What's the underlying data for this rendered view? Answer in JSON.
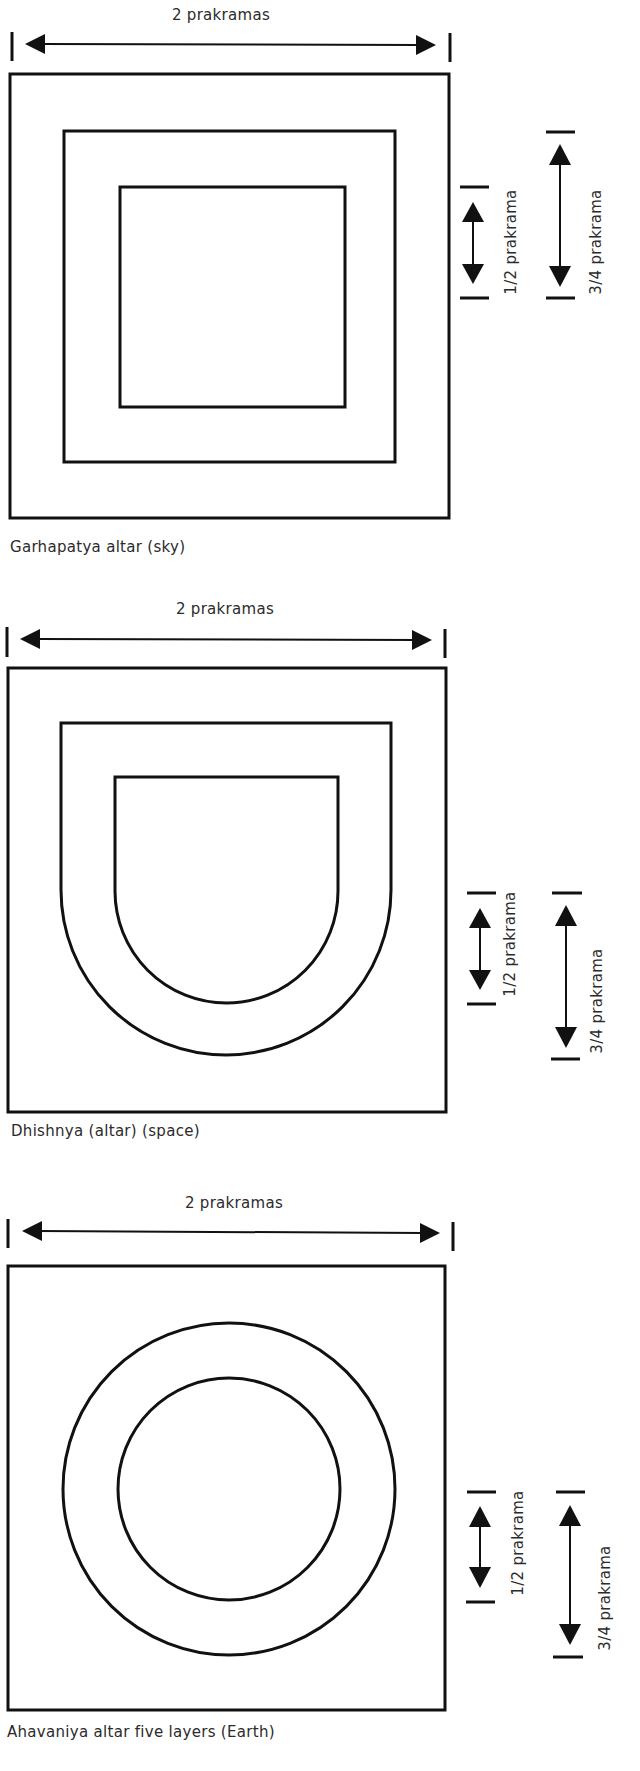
{
  "diagrams": [
    {
      "name": "garhapatya",
      "width_label": "2 prakramas",
      "half_label": "1/2 prakrama",
      "three_quarter_label": "3/4 prakrama",
      "caption": "Garhapatya altar (sky)",
      "shape": "square"
    },
    {
      "name": "dhishnya",
      "width_label": "2 prakramas",
      "half_label": "1/2 prakrama",
      "three_quarter_label": "3/4 prakrama",
      "caption": "Dhishnya (altar) (space)",
      "shape": "semicircle"
    },
    {
      "name": "ahavaniya",
      "width_label": "2 prakramas",
      "half_label": "1/2 prakrama",
      "three_quarter_label": "3/4 prakrama",
      "caption": "Ahavaniya altar five layers (Earth)",
      "shape": "circle"
    }
  ],
  "colors": {
    "line": "#111111",
    "text": "#2b2b2b",
    "background": "#ffffff"
  }
}
